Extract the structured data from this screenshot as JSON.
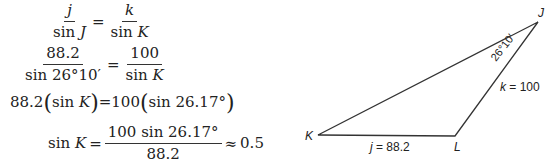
{
  "equations": {
    "line1": {
      "num_var": "j",
      "den_prefix": "sin",
      "den_var": "J",
      "equals": "=",
      "num2_var": "k",
      "den2_prefix": "sin",
      "den2_var": "K"
    },
    "line2": {
      "num": "88.2",
      "den": "sin 26°10′",
      "equals": "=",
      "num2": "100",
      "den2_prefix": "sin",
      "den2_var": "K"
    },
    "line3": {
      "left_coef": "88.2",
      "left_inner_prefix": "sin",
      "left_inner_var": "K",
      "equals": "=",
      "right_coef": "100",
      "right_inner": "sin 26.17°"
    },
    "line4": {
      "lhs_prefix": "sin",
      "lhs_var": "K",
      "equals": "=",
      "num": "100 sin 26.17°",
      "den": "88.2",
      "approx": "≈",
      "result": "0.5"
    }
  },
  "diagram": {
    "vertices": {
      "J": "J",
      "K": "K",
      "L": "L"
    },
    "angle_label": "26°10′",
    "side_k": {
      "var": "k",
      "text": " = 100"
    },
    "side_j": {
      "var": "j",
      "text": " = 88.2"
    },
    "line_color": "#333333"
  }
}
